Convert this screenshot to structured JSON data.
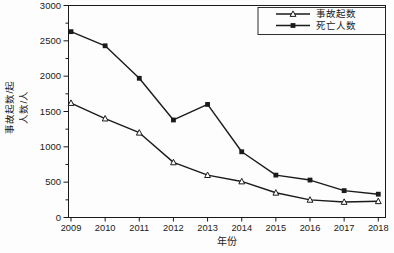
{
  "page": {
    "background": "#fdfdfd",
    "text_color": "#1a1a1a"
  },
  "chart_data": {
    "type": "line",
    "title": "",
    "xlabel": "年份",
    "ylabel_lines": [
      "事故起数/起",
      "人数/人"
    ],
    "x_years": [
      2009,
      2010,
      2011,
      2012,
      2013,
      2014,
      2015,
      2016,
      2017,
      2018
    ],
    "x_tick_labels": [
      "2009",
      "2010",
      "2011",
      "2012",
      "2013",
      "2014",
      "2015",
      "2016",
      "2017",
      "2018"
    ],
    "ylim": [
      0,
      3000
    ],
    "y_major_step": 500,
    "y_minor_step": 250,
    "y_tick_labels": [
      "0",
      "500",
      "1000",
      "1500",
      "2000",
      "2500",
      "3000"
    ],
    "grid": false,
    "frame": "full-box",
    "line_color": "#1a1a1a",
    "legend_position": "top-right-inside",
    "series": [
      {
        "name": "事故起数",
        "marker": "open-triangle",
        "values": [
          1620,
          1400,
          1200,
          780,
          600,
          510,
          350,
          250,
          220,
          230
        ]
      },
      {
        "name": "死亡人数",
        "marker": "filled-square",
        "values": [
          2630,
          2430,
          1970,
          1380,
          1600,
          930,
          600,
          530,
          380,
          330
        ]
      }
    ]
  }
}
